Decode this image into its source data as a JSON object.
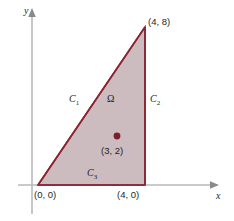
{
  "figure": {
    "type": "geometry-diagram",
    "axes": {
      "x_label": "x",
      "y_label": "y"
    },
    "region": {
      "label": "Ω",
      "fill_color": "#c9b8bd",
      "edge_color": "#8c2433"
    },
    "vertices": [
      {
        "name": "origin-vertex",
        "label": "(0, 0)",
        "x": 0,
        "y": 0
      },
      {
        "name": "bottom-right-vertex",
        "label": "(4, 0)",
        "x": 4,
        "y": 0
      },
      {
        "name": "apex-vertex",
        "label": "(4, 8)",
        "x": 4,
        "y": 8
      }
    ],
    "boundary_curves": [
      {
        "name": "curve-c1",
        "label": "C",
        "sub": "1",
        "from": "(0, 0)",
        "to": "(4, 8)"
      },
      {
        "name": "curve-c2",
        "label": "C",
        "sub": "2",
        "from": "(4, 8)",
        "to": "(4, 0)"
      },
      {
        "name": "curve-c3",
        "label": "C",
        "sub": "3",
        "from": "(4, 0)",
        "to": "(0, 0)"
      }
    ],
    "interior_point": {
      "label": "(3, 2)",
      "x": 3,
      "y": 2,
      "color": "#7d1f2b"
    }
  }
}
